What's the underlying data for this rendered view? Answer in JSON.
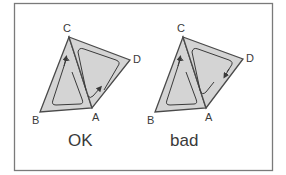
{
  "figure": {
    "frame_color": "#7a7a7a",
    "fill_color": "#d4d4d4",
    "stroke_color": "#4a4a4a",
    "panels": [
      {
        "caption": "OK",
        "vertices": {
          "C": "C",
          "D": "D",
          "A": "A",
          "B": "B"
        },
        "description": "Two triangles CBA and CAD sharing edge CA, with opposite circulation arrows (consistent orientation)"
      },
      {
        "caption": "bad",
        "vertices": {
          "C": "C",
          "D": "D",
          "A": "A",
          "B": "B"
        },
        "description": "Two triangles CBA and CAD sharing edge CA, with same-direction circulation arrows (inconsistent orientation)"
      }
    ]
  }
}
